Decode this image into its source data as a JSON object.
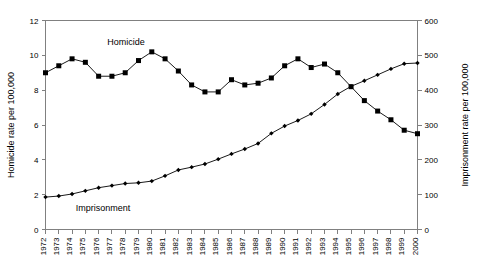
{
  "chart_data": {
    "type": "line",
    "title": "",
    "xlabel": "",
    "grid": false,
    "legend_position": "inline-annotations",
    "categories": [
      "1972",
      "1973",
      "1974",
      "1975",
      "1976",
      "1977",
      "1978",
      "1979",
      "1980",
      "1981",
      "1982",
      "1983",
      "1984",
      "1985",
      "1986",
      "1987",
      "1988",
      "1989",
      "1990",
      "1991",
      "1992",
      "1993",
      "1994",
      "1995",
      "1996",
      "1997",
      "1998",
      "1999",
      "2000"
    ],
    "axes": {
      "left": {
        "label": "Homicide rate per 100,000",
        "ticks": [
          0,
          2,
          4,
          6,
          8,
          10,
          12
        ],
        "lim": [
          0,
          12
        ]
      },
      "right": {
        "label": "Imprisonment rate per 100,000",
        "ticks": [
          0,
          100,
          200,
          300,
          400,
          500,
          600
        ],
        "lim": [
          0,
          600
        ]
      }
    },
    "series": [
      {
        "name": "Homicide",
        "axis": "left",
        "marker": "square",
        "color": "#000000",
        "values": [
          9.0,
          9.4,
          9.8,
          9.6,
          8.8,
          8.8,
          9.0,
          9.7,
          10.2,
          9.8,
          9.1,
          8.3,
          7.9,
          7.9,
          8.6,
          8.3,
          8.4,
          8.7,
          9.4,
          9.8,
          9.3,
          9.5,
          9.0,
          8.2,
          7.4,
          6.8,
          6.3,
          5.7,
          5.5
        ]
      },
      {
        "name": "Imprisonment",
        "axis": "right",
        "marker": "diamond",
        "color": "#000000",
        "values": [
          93,
          96,
          102,
          111,
          120,
          126,
          132,
          134,
          139,
          154,
          171,
          179,
          188,
          202,
          217,
          231,
          247,
          276,
          297,
          313,
          332,
          359,
          389,
          411,
          427,
          444,
          461,
          476,
          478
        ]
      }
    ],
    "annotations": [
      {
        "text": "Homicide",
        "series": "Homicide"
      },
      {
        "text": "Imprisonment",
        "series": "Imprisonment"
      }
    ]
  }
}
